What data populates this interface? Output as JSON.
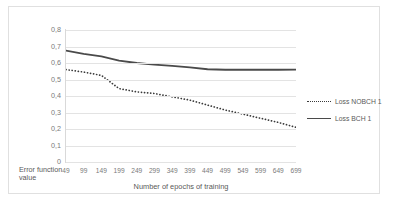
{
  "chart_data": {
    "type": "line",
    "title": "",
    "xlabel": "Number of epochs of training",
    "ylabel": "Error function value",
    "x": [
      49,
      99,
      149,
      199,
      249,
      299,
      349,
      399,
      449,
      499,
      549,
      599,
      649,
      699
    ],
    "xtick_labels": [
      "49",
      "99",
      "149",
      "199",
      "249",
      "299",
      "349",
      "399",
      "449",
      "499",
      "549",
      "599",
      "649",
      "699"
    ],
    "ytick_labels": [
      "0,8",
      "0,7",
      "0,6",
      "0,5",
      "0,4",
      "0,3",
      "0,2",
      "0,1",
      "0"
    ],
    "ytick_values": [
      0.8,
      0.7,
      0.6,
      0.5,
      0.4,
      0.3,
      0.2,
      0.1,
      0
    ],
    "ylim": [
      0,
      0.8
    ],
    "grid": "horizontal",
    "legend_position": "right",
    "series": [
      {
        "name": "Loss NOBCH 1",
        "style": "dotted",
        "color": "#3a3a3a",
        "values": [
          0.56,
          0.545,
          0.525,
          0.445,
          0.425,
          0.415,
          0.395,
          0.375,
          0.345,
          0.315,
          0.29,
          0.265,
          0.24,
          0.21
        ]
      },
      {
        "name": "Loss BCH 1",
        "style": "solid",
        "color": "#4a4a4a",
        "values": [
          0.675,
          0.655,
          0.64,
          0.615,
          0.6,
          0.59,
          0.583,
          0.573,
          0.562,
          0.559,
          0.559,
          0.559,
          0.559,
          0.56
        ]
      }
    ]
  },
  "legend": {
    "items": [
      {
        "label": "Loss NOBCH 1",
        "style": "dotted"
      },
      {
        "label": "Loss BCH 1",
        "style": "solid"
      }
    ]
  }
}
